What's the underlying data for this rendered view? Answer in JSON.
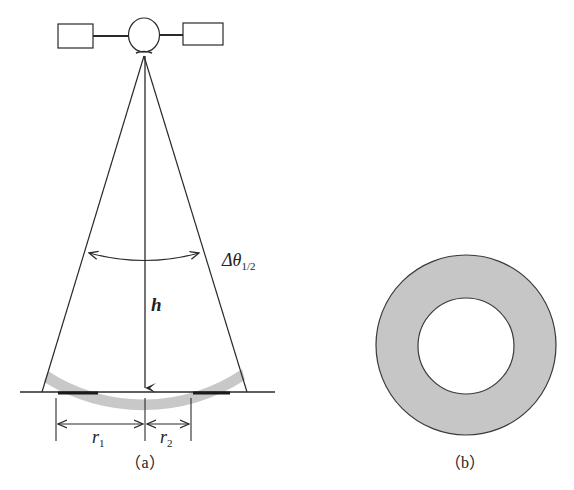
{
  "figure_a": {
    "caption": "（a）",
    "height_label": "h",
    "angle_label": {
      "main": "Δθ",
      "subscript": "1/2"
    },
    "r1_label": {
      "main": "r",
      "subscript": "1"
    },
    "r2_label": {
      "main": "r",
      "subscript": "2"
    }
  },
  "figure_b": {
    "caption": "（b）"
  },
  "colors": {
    "line": "#2a2a2a",
    "band_fill": "#c8c8c8",
    "annulus_fill": "#c6c6c6",
    "background": "#ffffff"
  }
}
